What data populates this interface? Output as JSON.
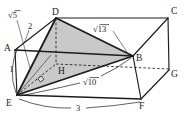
{
  "figure": {
    "kind": "solid-geometry-diagram",
    "solid": "rectangular-cuboid",
    "shaded_triangle": "D-E-B",
    "right_angle_mark_on": "segment-EH",
    "colors": {
      "line": "#1c1c1c",
      "shade": "#c9c9c9",
      "background": "#ffffff"
    },
    "vertices": {
      "a": "A",
      "b": "B",
      "c": "C",
      "d": "D",
      "e": "E",
      "f": "F",
      "g": "G",
      "h": "H"
    },
    "measurements": {
      "ae": "1",
      "ad": "2",
      "ef": "3",
      "ed": "√5",
      "eb": "√10",
      "db": "√13"
    }
  }
}
